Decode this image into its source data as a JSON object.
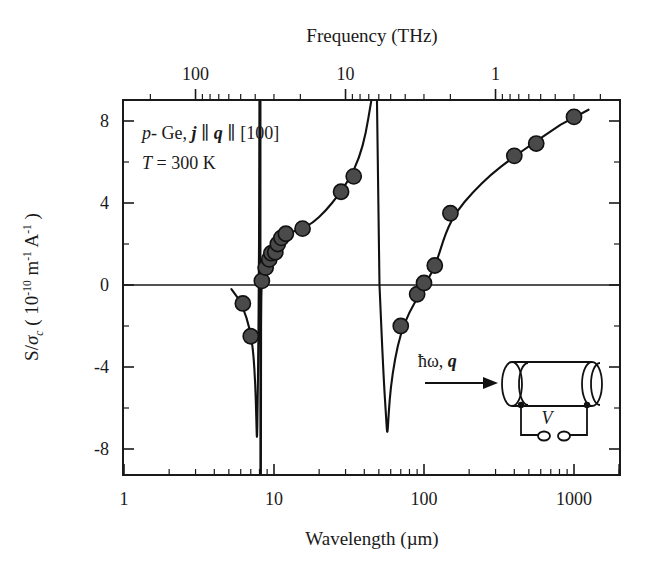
{
  "chart_data": {
    "type": "line",
    "title": "",
    "xlabel": "Wavelength (µm)",
    "ylabel": "S/σc ( 10-10 m-1 A-1 )",
    "top_axis_label": "Frequency (THz)",
    "xscale": "log",
    "xlim": [
      1,
      2000
    ],
    "ylim": [
      -9.2,
      9.4
    ],
    "grid": false,
    "legend": "none",
    "x_tick_labels": [
      "1",
      "10",
      "100",
      "1000"
    ],
    "x_tick_values": [
      1,
      10,
      100,
      1000
    ],
    "y_tick_labels": [
      "8",
      "4",
      "0",
      "-4",
      "-8"
    ],
    "y_tick_values": [
      8,
      4,
      0,
      -4,
      -8
    ],
    "top_tick_labels": [
      "100",
      "10",
      "1"
    ],
    "top_tick_values": [
      100,
      10,
      1
    ],
    "zero_line": 0,
    "marker_color": "#4a4a4a",
    "curve_color": "#111111",
    "series": [
      {
        "name": "S/sigma_c measured",
        "marker": "filled-circle",
        "points": [
          {
            "x": 6.2,
            "y": -0.9
          },
          {
            "x": 7.0,
            "y": -2.5
          },
          {
            "x": 8.3,
            "y": 0.2
          },
          {
            "x": 8.8,
            "y": 0.85
          },
          {
            "x": 9.3,
            "y": 1.25
          },
          {
            "x": 9.6,
            "y": 1.55
          },
          {
            "x": 10.2,
            "y": 1.6
          },
          {
            "x": 10.6,
            "y": 2.0
          },
          {
            "x": 11.2,
            "y": 2.3
          },
          {
            "x": 12.0,
            "y": 2.5
          },
          {
            "x": 15.5,
            "y": 2.75
          },
          {
            "x": 28.0,
            "y": 4.55
          },
          {
            "x": 34.0,
            "y": 5.3
          },
          {
            "x": 70.0,
            "y": -2.0
          },
          {
            "x": 90.0,
            "y": -0.45
          },
          {
            "x": 100.0,
            "y": 0.1
          },
          {
            "x": 118.0,
            "y": 0.95
          },
          {
            "x": 150.0,
            "y": 3.5
          },
          {
            "x": 400.0,
            "y": 6.3
          },
          {
            "x": 560.0,
            "y": 6.9
          },
          {
            "x": 1000.0,
            "y": 8.2
          }
        ]
      }
    ],
    "curve_description": "Theory curve with two sharp resonances: a narrow negative dip near 8 um reaching about -7.8, a divergence near 45 um going off the top of scale, and a second negative dip near 57 um reaching about -7.4, then rising smoothly to +8.4 at 1000 um.",
    "resonances": [
      {
        "wavelength": 8.1,
        "min_value": -7.8
      },
      {
        "wavelength": 57.0,
        "min_value": -7.4
      }
    ],
    "annotations": [
      {
        "id": "sample-label",
        "text": "p- Ge, j ∥ q ∥ [100]"
      },
      {
        "id": "temperature-label",
        "text": "T = 300 K"
      }
    ]
  },
  "annotation": {
    "material_prefix": "p",
    "material_dash": "- Ge, ",
    "current_symbol": "j",
    "parallel_1": " ∥ ",
    "wavevector_symbol": "q",
    "parallel_2": " ∥ ",
    "direction": "[100]",
    "temperature_symbol": "T",
    "temperature_value": " = 300 K"
  },
  "axes": {
    "top_title": "Frequency (THz)",
    "bottom_title": "Wavelength (µm)",
    "left_title_parts": {
      "main": "S/",
      "sigma": "σ",
      "sigma_sub": "c",
      "open": " ( 10",
      "exp1": "-10",
      "unit1": " m",
      "exp2": "-1",
      "unit2": " A",
      "exp3": "-1",
      "close": " )"
    }
  },
  "inset": {
    "name": "experiment-geometry-inset",
    "beam_label_hbar": "ħω, ",
    "beam_label_q": "q",
    "voltage_label": "V"
  }
}
